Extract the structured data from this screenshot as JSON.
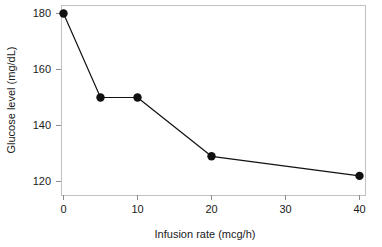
{
  "chart_data": {
    "type": "line",
    "title": "",
    "xlabel": "Infusion rate (mcg/h)",
    "ylabel": "Glucose level (mg/dL)",
    "x": [
      0,
      5,
      10,
      20,
      40
    ],
    "values": [
      180,
      150,
      150,
      129,
      122
    ],
    "series": [
      {
        "name": "Glucose level",
        "x": [
          0,
          5,
          10,
          20,
          40
        ],
        "values": [
          180,
          150,
          150,
          129,
          122
        ]
      }
    ],
    "xlim": [
      0,
      40
    ],
    "ylim": [
      118,
      181
    ],
    "xticks": [
      0,
      10,
      20,
      30,
      40
    ],
    "xtick_labels": [
      "0",
      "10",
      "20",
      "30",
      "40"
    ],
    "yticks": [
      120,
      140,
      160,
      180
    ],
    "ytick_labels": [
      "120",
      "140",
      "160",
      "180"
    ],
    "grid": false,
    "legend": false,
    "marker": "filled-circle",
    "line_color": "#111111",
    "marker_color": "#111111",
    "frame_color": "#c2c2c2",
    "background": "#ffffff"
  },
  "axes": {
    "x_title": "Infusion rate (mcg/h)",
    "y_title": "Glucose level (mg/dL)",
    "x_tick_labels": [
      "0",
      "10",
      "20",
      "30",
      "40"
    ],
    "y_tick_labels": [
      "120",
      "140",
      "160",
      "180"
    ]
  }
}
